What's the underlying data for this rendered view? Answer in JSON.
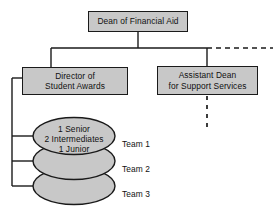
{
  "diagram": {
    "colors": {
      "node_fill": "#c8c8c8",
      "node_border": "#1a1a1a",
      "connector": "#1a1a1a",
      "background": "#ffffff"
    },
    "nodes": {
      "dean": {
        "label": "Dean of Financial Aid",
        "lines": "Dean of Financial Aid"
      },
      "director": {
        "label": "Director of Student Awards",
        "lines": "Director of\nStudent Awards"
      },
      "assistant_dean": {
        "label": "Assistant Dean for Support Services",
        "lines": "Assistant Dean\nfor Support Services"
      }
    },
    "team_stack": {
      "composition": "1 Senior\n2 Intermediates\n1 Junior",
      "composition_lines": [
        "1 Senior",
        "2 Intermediates",
        "1 Junior"
      ],
      "teams": [
        {
          "label": "Team 1"
        },
        {
          "label": "Team 2"
        },
        {
          "label": "Team 3"
        }
      ]
    }
  }
}
